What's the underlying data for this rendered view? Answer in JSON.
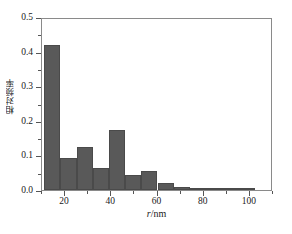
{
  "chart_data": {
    "type": "bar",
    "title": "",
    "subtitle": "",
    "xlabel": "r/nm",
    "xlabel_italic_part": "r",
    "xlabel_rest": "/nm",
    "ylabel": "相对频率",
    "xlim": [
      10,
      110
    ],
    "ylim": [
      0.0,
      0.5
    ],
    "grid": false,
    "legend": null,
    "bar_color": "#595959",
    "bar_edge_color": "#4a4a4a",
    "axis_color": "#8a8a8a",
    "bin_width": 7,
    "x_ticks_major": [
      20,
      40,
      60,
      80,
      100
    ],
    "x_ticks_major_labels": [
      "20",
      "40",
      "60",
      "80",
      "100"
    ],
    "x_ticks_minor": [
      10,
      30,
      50,
      70,
      90,
      110
    ],
    "y_ticks_major": [
      0.0,
      0.1,
      0.2,
      0.3,
      0.4,
      0.5
    ],
    "y_ticks_major_labels": [
      "0.0",
      "0.1",
      "0.2",
      "0.3",
      "0.4",
      "0.5"
    ],
    "y_ticks_minor": [
      0.05,
      0.15,
      0.25,
      0.35,
      0.45
    ],
    "categories": [
      "11",
      "18",
      "25",
      "32",
      "39",
      "46",
      "53",
      "60",
      "67",
      "74",
      "81",
      "88",
      "95"
    ],
    "bin_starts": [
      11,
      18,
      25,
      32,
      39,
      46,
      53,
      60,
      67,
      74,
      81,
      88,
      95
    ],
    "values": [
      0.42,
      0.092,
      0.124,
      0.063,
      0.173,
      0.043,
      0.055,
      0.021,
      0.01,
      0.005,
      0.003,
      0.001,
      0.001
    ]
  }
}
